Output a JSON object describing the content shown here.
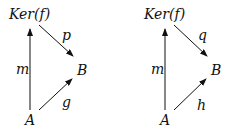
{
  "diagrams": [
    {
      "objects": {
        "top": "Ker(f)",
        "right": "B",
        "bottom": "A"
      },
      "morphisms": {
        "vertical": "m",
        "diagonal_down": "p",
        "diagonal_up": "g"
      }
    },
    {
      "objects": {
        "top": "Ker(f)",
        "right": "B",
        "bottom": "A"
      },
      "morphisms": {
        "vertical": "m",
        "diagonal_down": "q",
        "diagonal_up": "h"
      }
    }
  ],
  "colors": {
    "ink": "#111111",
    "background": "#ffffff"
  }
}
